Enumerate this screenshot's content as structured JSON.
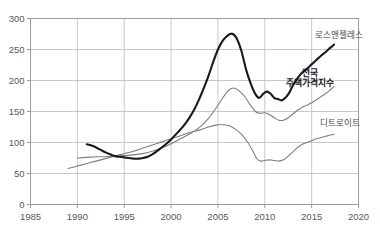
{
  "chart_data": {
    "type": "line",
    "title": "",
    "xlabel": "",
    "ylabel": "",
    "xlim": [
      1985,
      2020
    ],
    "ylim": [
      0,
      300
    ],
    "grid": true,
    "legend_position": "inline-right",
    "xticks": [
      "1985",
      "1990",
      "1995",
      "2000",
      "2005",
      "2010",
      "2015",
      "2020"
    ],
    "yticks": [
      "0",
      "50",
      "100",
      "150",
      "200",
      "250",
      "300"
    ],
    "series": [
      {
        "name": "로스앤젤레스",
        "color": "#1a1a1a",
        "width": 2.1,
        "label_x": 2015.4,
        "label_y": 268,
        "label_bold": false,
        "x": [
          1991.0,
          1991.5,
          1992.0,
          1992.5,
          1993.0,
          1993.5,
          1994.0,
          1994.5,
          1995.0,
          1995.5,
          1996.0,
          1996.5,
          1997.0,
          1997.5,
          1998.0,
          1998.5,
          1999.0,
          1999.5,
          2000.0,
          2000.5,
          2001.0,
          2001.5,
          2002.0,
          2002.5,
          2003.0,
          2003.5,
          2004.0,
          2004.5,
          2005.0,
          2005.5,
          2006.0,
          2006.3,
          2006.6,
          2007.0,
          2007.5,
          2008.0,
          2008.5,
          2009.0,
          2009.4,
          2009.8,
          2010.2,
          2010.6,
          2011.0,
          2011.4,
          2011.8,
          2012.2,
          2012.6,
          2013.0,
          2013.5,
          2014.0,
          2014.5,
          2015.0,
          2015.5,
          2016.0,
          2016.5,
          2017.0,
          2017.4
        ],
        "y": [
          97,
          95,
          92,
          88,
          84,
          81,
          78,
          77,
          76,
          75,
          74,
          74,
          75,
          77,
          81,
          86,
          92,
          98,
          105,
          113,
          121,
          130,
          141,
          154,
          170,
          188,
          208,
          230,
          250,
          264,
          272,
          275,
          275,
          268,
          248,
          218,
          195,
          178,
          172,
          178,
          182,
          179,
          172,
          170,
          168,
          172,
          180,
          192,
          204,
          213,
          219,
          226,
          233,
          240,
          246,
          253,
          258
        ]
      },
      {
        "name": "전국 주택가격지수",
        "color": "#7d7e80",
        "width": 1.1,
        "label_x": 2014.8,
        "label_y": 208,
        "label_bold": true,
        "x": [
          1990.0,
          1991.0,
          1992.0,
          1993.0,
          1994.0,
          1995.0,
          1996.0,
          1997.0,
          1998.0,
          1999.0,
          2000.0,
          2001.0,
          2002.0,
          2003.0,
          2004.0,
          2005.0,
          2005.7,
          2006.2,
          2006.7,
          2007.2,
          2007.8,
          2008.4,
          2009.0,
          2009.5,
          2010.0,
          2010.5,
          2011.0,
          2011.5,
          2012.0,
          2012.5,
          2013.0,
          2013.5,
          2014.0,
          2014.5,
          2015.0,
          2015.5,
          2016.0,
          2016.5,
          2017.0,
          2017.4
        ],
        "y": [
          75,
          76,
          77,
          77,
          78,
          79,
          80,
          82,
          86,
          91,
          98,
          106,
          114,
          124,
          139,
          160,
          176,
          185,
          188,
          184,
          175,
          162,
          150,
          147,
          148,
          145,
          140,
          136,
          136,
          140,
          146,
          152,
          157,
          160,
          164,
          169,
          174,
          179,
          185,
          190
        ]
      },
      {
        "name": "디트로이트",
        "color": "#7d7e80",
        "width": 1.1,
        "label_x": 2015.9,
        "label_y": 126,
        "label_bold": false,
        "x": [
          1989.0,
          1990.0,
          1991.0,
          1992.0,
          1993.0,
          1994.0,
          1995.0,
          1996.0,
          1997.0,
          1998.0,
          1999.0,
          2000.0,
          2001.0,
          2002.0,
          2003.0,
          2004.0,
          2004.8,
          2005.4,
          2005.9,
          2006.4,
          2007.0,
          2007.6,
          2008.2,
          2008.8,
          2009.2,
          2009.6,
          2010.0,
          2010.5,
          2011.0,
          2011.5,
          2012.0,
          2012.5,
          2013.0,
          2013.5,
          2014.0,
          2014.5,
          2015.0,
          2015.5,
          2016.0,
          2016.5,
          2017.0,
          2017.4
        ],
        "y": [
          58,
          62,
          66,
          70,
          74,
          78,
          82,
          86,
          91,
          96,
          101,
          106,
          111,
          116,
          120,
          125,
          128,
          129,
          128,
          126,
          120,
          112,
          100,
          84,
          73,
          70,
          71,
          72,
          71,
          70,
          72,
          78,
          85,
          92,
          97,
          100,
          103,
          106,
          108,
          110,
          112,
          113
        ]
      }
    ]
  },
  "axes": {
    "y_tick_labels": [
      "300",
      "250",
      "200",
      "150",
      "100",
      "50",
      "0"
    ],
    "x_tick_labels": [
      "1985",
      "1990",
      "1995",
      "2000",
      "2005",
      "2010",
      "2015",
      "2020"
    ]
  },
  "colors": {
    "grid": "#b9bbbd",
    "frame": "#9a9c9e",
    "primary_line": "#1a1a1a",
    "secondary_line": "#7d7e80",
    "tick_text": "#58595b",
    "background": "#ffffff"
  }
}
